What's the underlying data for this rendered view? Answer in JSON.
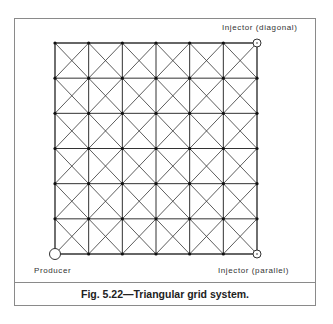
{
  "figure": {
    "caption": "Fig. 5.22—Triangular grid system.",
    "labels": {
      "injector_diagonal": "Injector (diagonal)",
      "producer": "Producer",
      "injector_parallel": "Injector (parallel)"
    },
    "grid": {
      "cells_x": 6,
      "cells_y": 6,
      "diagonals": "both",
      "line_color": "#333333",
      "node_color": "#111111"
    },
    "wells": [
      {
        "name": "producer",
        "position": "bottom-left",
        "symbol": "open-circle"
      },
      {
        "name": "injector-diagonal",
        "position": "top-right",
        "symbol": "open-circle"
      },
      {
        "name": "injector-parallel",
        "position": "bottom-right",
        "symbol": "open-circle"
      }
    ]
  }
}
